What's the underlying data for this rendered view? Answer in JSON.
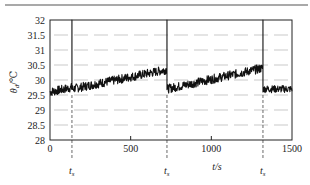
{
  "chart_data": {
    "type": "line",
    "title": "",
    "xlabel": "t/s",
    "ylabel": "θd/℃",
    "ylabel_main": "θ",
    "ylabel_sub": "d",
    "ylabel_unit": "/℃",
    "xlim": [
      0,
      1500
    ],
    "ylim": [
      28,
      32
    ],
    "x_ticks": [
      0,
      500,
      1000,
      1500
    ],
    "x_tick_labels": [
      "0",
      "500",
      "1000",
      "1500"
    ],
    "y_ticks": [
      28,
      28.5,
      29,
      29.5,
      30,
      30.5,
      31,
      31.5,
      32
    ],
    "y_tick_labels": [
      "28",
      "28.5",
      "29",
      "29.5",
      "30",
      "30.5",
      "31",
      "31.5",
      "32"
    ],
    "grid": "horizontal dashed",
    "annotations": [
      {
        "text": "ts",
        "main": "t",
        "sub": "s",
        "x": 136,
        "style": "dashed vertical line"
      },
      {
        "text": "ts",
        "main": "t",
        "sub": "s",
        "x": 725,
        "style": "dashed vertical line"
      },
      {
        "text": "ts",
        "main": "t",
        "sub": "s",
        "x": 1320,
        "style": "dashed vertical line"
      }
    ],
    "series": [
      {
        "name": "θd",
        "description": "Noisy temperature signal; sawtooth drift with spikes to 32 at each ts",
        "segments": [
          {
            "x_start": 0,
            "x_end": 136,
            "y_start": 29.6,
            "y_end": 29.75,
            "noise": 0.15
          },
          {
            "x_start": 136,
            "x_end": 725,
            "y_start": 29.7,
            "y_end": 30.35,
            "noise": 0.15
          },
          {
            "x_start": 725,
            "x_end": 1320,
            "y_start": 29.7,
            "y_end": 30.4,
            "noise": 0.15
          },
          {
            "x_start": 1320,
            "x_end": 1500,
            "y_start": 29.7,
            "y_end": 29.7,
            "noise": 0.12
          }
        ],
        "spikes": [
          {
            "x": 136,
            "y": 32
          },
          {
            "x": 725,
            "y": 32
          },
          {
            "x": 1320,
            "y": 32
          }
        ]
      }
    ]
  },
  "colors": {
    "line": "#111111",
    "axis": "#222222",
    "grid": "#bbbbbb",
    "rule": "#555555"
  }
}
